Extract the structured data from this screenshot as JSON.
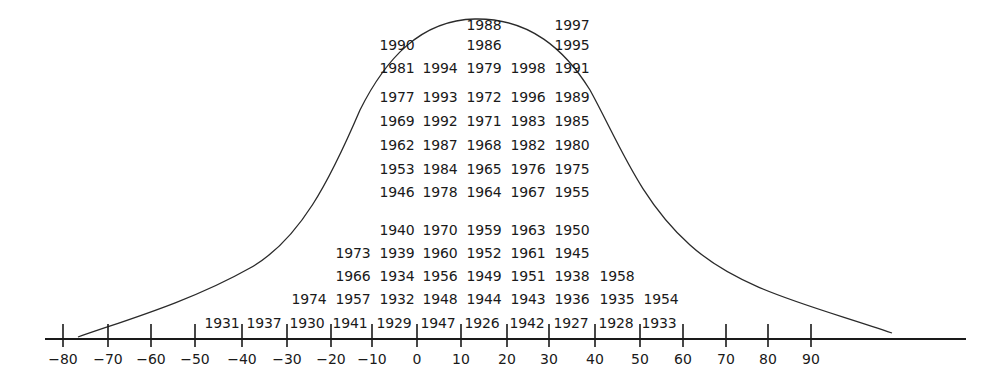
{
  "chart_data": {
    "type": "scatter",
    "title": "",
    "xlabel": "",
    "ylabel": "",
    "grid": false,
    "legend": null,
    "xlim": [
      -80,
      90
    ],
    "x_ticks": [
      -80,
      -70,
      -60,
      -50,
      -40,
      -30,
      -20,
      -10,
      0,
      10,
      20,
      30,
      40,
      50,
      60,
      70,
      80,
      90
    ],
    "x_tick_labels": [
      "−80",
      "−70",
      "−60",
      "−50",
      "−40",
      "−30",
      "−20",
      "−10",
      "0",
      "10",
      "20",
      "30",
      "40",
      "50",
      "60",
      "70",
      "80",
      "90"
    ],
    "bins": [
      {
        "range": [
          -50,
          -40
        ],
        "years": [
          "1931"
        ]
      },
      {
        "range": [
          -40,
          -30
        ],
        "years": [
          "1937"
        ]
      },
      {
        "range": [
          -30,
          -20
        ],
        "years": [
          "1930",
          "1974"
        ]
      },
      {
        "range": [
          -20,
          -10
        ],
        "years": [
          "1941",
          "1957",
          "1966",
          "1973"
        ]
      },
      {
        "range": [
          -10,
          0
        ],
        "years": [
          "1929",
          "1932",
          "1934",
          "1939",
          "1940",
          "1946",
          "1953",
          "1962",
          "1969",
          "1977",
          "1981",
          "1990"
        ]
      },
      {
        "range": [
          0,
          10
        ],
        "years": [
          "1947",
          "1948",
          "1956",
          "1960",
          "1970",
          "1978",
          "1984",
          "1987",
          "1992",
          "1993",
          "1994"
        ]
      },
      {
        "range": [
          10,
          20
        ],
        "years": [
          "1926",
          "1944",
          "1949",
          "1952",
          "1959",
          "1964",
          "1965",
          "1968",
          "1971",
          "1972",
          "1979",
          "1986",
          "1988"
        ]
      },
      {
        "range": [
          20,
          30
        ],
        "years": [
          "1942",
          "1943",
          "1951",
          "1961",
          "1963",
          "1967",
          "1976",
          "1982",
          "1983",
          "1996",
          "1998"
        ]
      },
      {
        "range": [
          30,
          40
        ],
        "years": [
          "1927",
          "1936",
          "1938",
          "1945",
          "1950",
          "1955",
          "1975",
          "1980",
          "1985",
          "1989",
          "1991",
          "1995",
          "1997"
        ]
      },
      {
        "range": [
          40,
          50
        ],
        "years": [
          "1928",
          "1935",
          "1958"
        ]
      },
      {
        "range": [
          50,
          60
        ],
        "years": [
          "1933",
          "1954"
        ]
      }
    ],
    "counts": [
      1,
      1,
      2,
      4,
      12,
      11,
      13,
      11,
      13,
      3,
      2
    ],
    "curve": {
      "type": "normal",
      "approx_mean": 13,
      "label": ""
    }
  },
  "rows": [
    {
      "y": 330,
      "cells": [
        {
          "x": 222,
          "t": "1931"
        },
        {
          "x": 264,
          "t": "1937"
        },
        {
          "x": 307,
          "t": "1930"
        },
        {
          "x": 350,
          "t": "1941"
        },
        {
          "x": 394,
          "t": "1929"
        },
        {
          "x": 438,
          "t": "1947"
        },
        {
          "x": 482,
          "t": "1926"
        },
        {
          "x": 527,
          "t": "1942"
        },
        {
          "x": 571,
          "t": "1927"
        },
        {
          "x": 616,
          "t": "1928"
        },
        {
          "x": 659,
          "t": "1933"
        }
      ]
    },
    {
      "y": 306,
      "cells": [
        {
          "x": 309,
          "t": "1974"
        },
        {
          "x": 353,
          "t": "1957"
        },
        {
          "x": 397,
          "t": "1932"
        },
        {
          "x": 440,
          "t": "1948"
        },
        {
          "x": 484,
          "t": "1944"
        },
        {
          "x": 528,
          "t": "1943"
        },
        {
          "x": 572,
          "t": "1936"
        },
        {
          "x": 617,
          "t": "1935"
        },
        {
          "x": 661,
          "t": "1954"
        }
      ]
    },
    {
      "y": 283,
      "cells": [
        {
          "x": 353,
          "t": "1966"
        },
        {
          "x": 397,
          "t": "1934"
        },
        {
          "x": 440,
          "t": "1956"
        },
        {
          "x": 484,
          "t": "1949"
        },
        {
          "x": 528,
          "t": "1951"
        },
        {
          "x": 572,
          "t": "1938"
        },
        {
          "x": 617,
          "t": "1958"
        }
      ]
    },
    {
      "y": 260,
      "cells": [
        {
          "x": 353,
          "t": "1973"
        },
        {
          "x": 397,
          "t": "1939"
        },
        {
          "x": 440,
          "t": "1960"
        },
        {
          "x": 484,
          "t": "1952"
        },
        {
          "x": 528,
          "t": "1961"
        },
        {
          "x": 572,
          "t": "1945"
        }
      ]
    },
    {
      "y": 237,
      "cells": [
        {
          "x": 397,
          "t": "1940"
        },
        {
          "x": 440,
          "t": "1970"
        },
        {
          "x": 484,
          "t": "1959"
        },
        {
          "x": 528,
          "t": "1963"
        },
        {
          "x": 572,
          "t": "1950"
        }
      ]
    },
    {
      "y": 199,
      "cells": [
        {
          "x": 397,
          "t": "1946"
        },
        {
          "x": 440,
          "t": "1978"
        },
        {
          "x": 484,
          "t": "1964"
        },
        {
          "x": 528,
          "t": "1967"
        },
        {
          "x": 572,
          "t": "1955"
        }
      ]
    },
    {
      "y": 176,
      "cells": [
        {
          "x": 397,
          "t": "1953"
        },
        {
          "x": 440,
          "t": "1984"
        },
        {
          "x": 484,
          "t": "1965"
        },
        {
          "x": 528,
          "t": "1976"
        },
        {
          "x": 572,
          "t": "1975"
        }
      ]
    },
    {
      "y": 152,
      "cells": [
        {
          "x": 397,
          "t": "1962"
        },
        {
          "x": 440,
          "t": "1987"
        },
        {
          "x": 484,
          "t": "1968"
        },
        {
          "x": 528,
          "t": "1982"
        },
        {
          "x": 572,
          "t": "1980"
        }
      ]
    },
    {
      "y": 128,
      "cells": [
        {
          "x": 397,
          "t": "1969"
        },
        {
          "x": 440,
          "t": "1992"
        },
        {
          "x": 484,
          "t": "1971"
        },
        {
          "x": 528,
          "t": "1983"
        },
        {
          "x": 572,
          "t": "1985"
        }
      ]
    },
    {
      "y": 104,
      "cells": [
        {
          "x": 397,
          "t": "1977"
        },
        {
          "x": 440,
          "t": "1993"
        },
        {
          "x": 484,
          "t": "1972"
        },
        {
          "x": 528,
          "t": "1996"
        },
        {
          "x": 572,
          "t": "1989"
        }
      ]
    },
    {
      "y": 75,
      "cells": [
        {
          "x": 397,
          "t": "1981"
        },
        {
          "x": 440,
          "t": "1994"
        },
        {
          "x": 484,
          "t": "1979"
        },
        {
          "x": 528,
          "t": "1998"
        },
        {
          "x": 572,
          "t": "1991"
        }
      ]
    },
    {
      "y": 52,
      "cells": [
        {
          "x": 397,
          "t": "1990"
        },
        {
          "x": 484,
          "t": "1986"
        },
        {
          "x": 572,
          "t": "1995"
        }
      ]
    },
    {
      "y": 32,
      "cells": [
        {
          "x": 484,
          "t": "1988"
        },
        {
          "x": 572,
          "t": "1997"
        }
      ]
    }
  ],
  "axis": {
    "y": 339,
    "x_start": 45,
    "x_end": 966,
    "ticks": [
      {
        "x": 63,
        "label": "−80"
      },
      {
        "x": 108,
        "label": "−70"
      },
      {
        "x": 151,
        "label": "−60"
      },
      {
        "x": 195,
        "label": "−50"
      },
      {
        "x": 242,
        "label": "−40"
      },
      {
        "x": 287,
        "label": "−30"
      },
      {
        "x": 331,
        "label": "−20"
      },
      {
        "x": 372,
        "label": "−10"
      },
      {
        "x": 417,
        "label": "0"
      },
      {
        "x": 461,
        "label": "10"
      },
      {
        "x": 507,
        "label": "20"
      },
      {
        "x": 549,
        "label": "30"
      },
      {
        "x": 595,
        "label": "40"
      },
      {
        "x": 640,
        "label": "50"
      },
      {
        "x": 683,
        "label": "60"
      },
      {
        "x": 726,
        "label": "70"
      },
      {
        "x": 768,
        "label": "80"
      },
      {
        "x": 811,
        "label": "90"
      }
    ]
  },
  "style": {
    "ink": "#1a1a1a",
    "curve": "#2a2a2a",
    "background": "#ffffff"
  }
}
